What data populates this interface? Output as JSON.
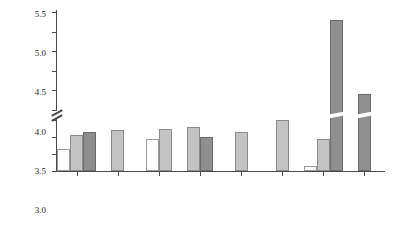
{
  "chart_data": {
    "type": "bar",
    "title": "",
    "xlabel": "",
    "ylabel": "Plasma Se (μmol/L)",
    "categories": [
      "New Zealand",
      "Australia",
      "Finland",
      "UK",
      "France",
      "USA",
      "China",
      "Venezuela"
    ],
    "series": [
      {
        "name": "series-1",
        "color": "#fdfdfd",
        "values": [
          0.65,
          null,
          0.95,
          null,
          null,
          null,
          0.15,
          null
        ]
      },
      {
        "name": "series-2",
        "color": "#c4c4c4",
        "values": [
          1.05,
          1.2,
          1.25,
          1.3,
          1.15,
          1.5,
          0.95,
          null
        ]
      },
      {
        "name": "series-3",
        "color": "#8f8f8f",
        "values": [
          1.15,
          null,
          null,
          1.0,
          null,
          null,
          5.3,
          3.4
        ]
      }
    ],
    "ylim": [
      0,
      5.5
    ],
    "yticks": [
      0,
      0.5,
      1.0,
      1.5,
      3.0,
      3.5,
      4.0,
      4.5,
      5.0,
      5.5
    ],
    "ytick_labels": [
      "0",
      "0.5",
      "1.0",
      "1.5",
      "3.0",
      "3.5",
      "4.0",
      "4.5",
      "5.0",
      "5.5"
    ],
    "axis_break": {
      "from": 1.5,
      "to": 3.0,
      "present": true
    },
    "grid": false,
    "legend": "none",
    "xtick_rotation": -45
  },
  "axis": {
    "y_label": "Plasma Se (μmol/L)",
    "ticks": [
      {
        "label": "5.5",
        "value": 5.5
      },
      {
        "label": "5.0",
        "value": 5.0
      },
      {
        "label": "4.5",
        "value": 4.5
      },
      {
        "label": "4.0",
        "value": 4.0
      },
      {
        "label": "3.5",
        "value": 3.5
      },
      {
        "label": "3.0",
        "value": 3.0
      },
      {
        "label": "1.5",
        "value": 1.5
      },
      {
        "label": "1.0",
        "value": 1.0
      },
      {
        "label": "0.5",
        "value": 0.5
      },
      {
        "label": "0",
        "value": 0
      }
    ]
  },
  "categories": [
    {
      "label": "New Zealand"
    },
    {
      "label": "Australia"
    },
    {
      "label": "Finland"
    },
    {
      "label": "UK"
    },
    {
      "label": "France"
    },
    {
      "label": "USA"
    },
    {
      "label": "China"
    },
    {
      "label": "Venezuela"
    }
  ],
  "colors": {
    "series_1": "#fdfdfd",
    "series_2": "#c4c4c4",
    "series_3": "#8f8f8f",
    "axis": "#4a4a4a",
    "background": "#ffffff"
  }
}
